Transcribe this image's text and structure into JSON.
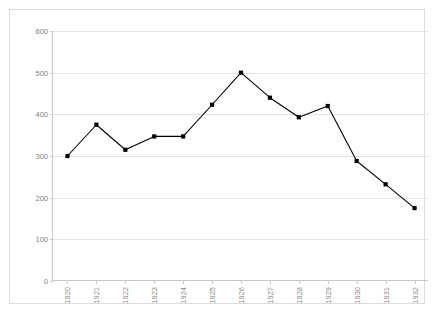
{
  "chart_data": {
    "type": "line",
    "title": "",
    "xlabel": "",
    "ylabel": "",
    "categories": [
      "1920",
      "1921",
      "1922",
      "1923",
      "1924",
      "1925",
      "1926",
      "1927",
      "1928",
      "1929",
      "1930",
      "1931",
      "1932"
    ],
    "values": [
      300,
      375,
      315,
      347,
      347,
      423,
      500,
      440,
      393,
      420,
      288,
      232,
      175
    ],
    "series": [
      {
        "name": "",
        "values": [
          300,
          375,
          315,
          347,
          347,
          423,
          500,
          440,
          393,
          420,
          288,
          232,
          175
        ]
      }
    ],
    "ylim": [
      0,
      600
    ],
    "ytick_values": [
      0,
      100,
      200,
      300,
      400,
      500,
      600
    ],
    "ytick_labels": [
      "0",
      "100",
      "200",
      "300",
      "400",
      "500",
      "600"
    ],
    "grid": "horizontal",
    "legend": "none",
    "marker": "square",
    "line_color": "#000000",
    "marker_color": "#000000",
    "grid_color": "#e2e2e2",
    "axis_color": "#c8c8c8",
    "tick_label_color": "#808080",
    "background_color": "#ffffff",
    "border_color": "#dcdcdc"
  },
  "figure": {
    "clipped_title_text": ""
  }
}
